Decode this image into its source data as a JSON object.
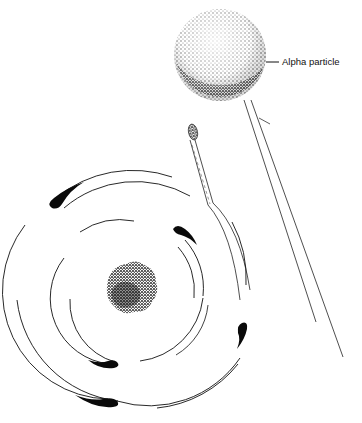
{
  "figure": {
    "type": "atom-diagram",
    "labels": {
      "alpha_particle": "Alpha particle"
    },
    "colors": {
      "ink": "#111111",
      "background": "#ffffff"
    },
    "elements": {
      "alpha_particle": {
        "cx": 220,
        "cy": 55,
        "r": 46
      },
      "nucleus": {
        "cx": 131,
        "cy": 291,
        "r": 27
      },
      "orbits_center": {
        "cx": 131,
        "cy": 291
      },
      "inner_orbit_radii": [
        60,
        66
      ],
      "outer_orbit_radii": [
        100,
        108
      ],
      "electron_count": 6
    }
  }
}
